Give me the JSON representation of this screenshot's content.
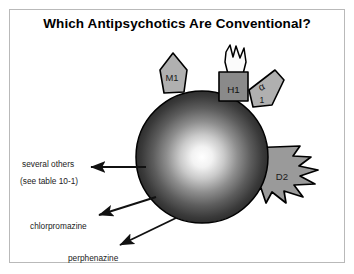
{
  "figure": {
    "title": "Which Antipsychotics Are Conventional?",
    "frame_border_color": "#b9b9b9",
    "background_color": "#ffffff"
  },
  "diagram": {
    "type": "receptor-binding-schematic",
    "central_body": {
      "name": "drug-sphere",
      "shape": "sphere",
      "gradient": "radial",
      "center_color": "#ffffff",
      "edge_color": "#1c1c1c",
      "outline_color": "#000000"
    },
    "receptors": [
      {
        "id": "m1",
        "label": "M1",
        "shape": "pentagon",
        "fill": "#b0b0b0",
        "stroke": "#000000",
        "position": "top-left-of-sphere"
      },
      {
        "id": "h1",
        "label": "H1",
        "shape": "rectangle-with-flame",
        "fill": "#8a8a8a",
        "stroke": "#000000",
        "position": "top-of-sphere"
      },
      {
        "id": "alpha1",
        "label": "α",
        "sublabel": "1",
        "shape": "tilted-pentagon",
        "fill": "#b0b0b0",
        "stroke": "#000000",
        "position": "top-right-of-sphere"
      },
      {
        "id": "d2",
        "label": "D2",
        "shape": "jagged-wedge",
        "fill": "#9a9a9a",
        "stroke": "#000000",
        "position": "right-of-sphere"
      }
    ],
    "annotations": [
      {
        "id": "several-others",
        "text": "several others",
        "arrow": "horizontal-left"
      },
      {
        "id": "see-table",
        "text": "(see table 10-1)",
        "arrow": "none"
      },
      {
        "id": "chlorpromazine",
        "text": "chlorpromazine",
        "arrow": "diagonal-down-left"
      },
      {
        "id": "perphenazine",
        "text": "perphenazine",
        "arrow": "diagonal-down-left"
      }
    ]
  }
}
